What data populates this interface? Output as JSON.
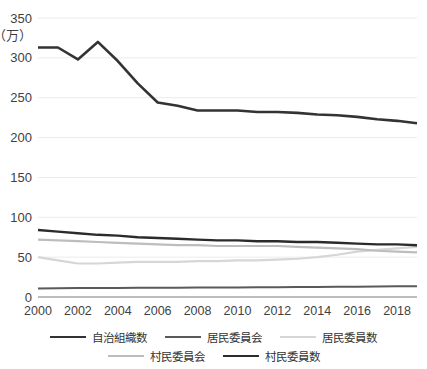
{
  "chart_data": {
    "type": "line",
    "title": "",
    "subtitle": "",
    "xlabel": "",
    "ylabel": "",
    "unit_label": "（万）",
    "xlim": [
      2000,
      2019
    ],
    "ylim": [
      0,
      350
    ],
    "ytick_values": [
      0,
      50,
      100,
      150,
      200,
      250,
      300,
      350
    ],
    "ytick_labels": [
      "0",
      "50",
      "100",
      "150",
      "200",
      "250",
      "300",
      "350"
    ],
    "xtick_values": [
      2000,
      2002,
      2004,
      2006,
      2008,
      2010,
      2012,
      2014,
      2016,
      2018
    ],
    "xtick_labels": [
      "2000",
      "2002",
      "2004",
      "2006",
      "2008",
      "2010",
      "2012",
      "2014",
      "2016",
      "2018"
    ],
    "grid": true,
    "grid_axis": "y",
    "legend_position": "bottom",
    "x": [
      2000,
      2001,
      2002,
      2003,
      2004,
      2005,
      2006,
      2007,
      2008,
      2009,
      2010,
      2011,
      2012,
      2013,
      2014,
      2015,
      2016,
      2017,
      2018,
      2019
    ],
    "series": [
      {
        "name": "自治組織数",
        "color": "#333333",
        "width": 2.6,
        "values": [
          313,
          313,
          298,
          320,
          296,
          268,
          244,
          240,
          234,
          234,
          234,
          232,
          232,
          231,
          229,
          228,
          226,
          223,
          221,
          218
        ]
      },
      {
        "name": "居民委員会",
        "color": "#5a5a5a",
        "width": 2.0,
        "values": [
          10.8,
          11.0,
          11.2,
          11.3,
          11.4,
          11.5,
          11.6,
          11.7,
          11.8,
          11.9,
          12.0,
          12.1,
          12.2,
          12.4,
          12.6,
          12.8,
          13.0,
          13.2,
          13.4,
          13.6
        ]
      },
      {
        "name": "居民委員数",
        "color": "#d6d6d6",
        "width": 2.2,
        "values": [
          50,
          46,
          42,
          42,
          43,
          44,
          44,
          44,
          45,
          45,
          46,
          46,
          47,
          48,
          50,
          53,
          57,
          59,
          61,
          63
        ]
      },
      {
        "name": "村民委員会",
        "color": "#bdbdbd",
        "width": 2.2,
        "values": [
          72,
          71,
          70,
          69,
          68,
          67,
          66,
          65,
          65,
          64,
          64,
          64,
          64,
          63,
          62,
          61,
          60,
          58,
          57,
          56
        ]
      },
      {
        "name": "村民委員数",
        "color": "#2b2b2b",
        "width": 2.4,
        "values": [
          84,
          82,
          80,
          78,
          77,
          75,
          74,
          73,
          72,
          71,
          71,
          70,
          70,
          69,
          69,
          68,
          67,
          66,
          66,
          65
        ]
      }
    ]
  },
  "legend": {
    "rows": [
      [
        {
          "label": "自治組織数",
          "color": "#333333",
          "width": 2.8
        },
        {
          "label": "居民委員会",
          "color": "#5a5a5a",
          "width": 2.2
        },
        {
          "label": "居民委員数",
          "color": "#d6d6d6",
          "width": 2.4
        }
      ],
      [
        {
          "label": "村民委員会",
          "color": "#bdbdbd",
          "width": 2.4
        },
        {
          "label": "村民委員数",
          "color": "#2b2b2b",
          "width": 2.8
        }
      ]
    ]
  },
  "axes": {
    "grid_color": "#ebebeb",
    "axis_color": "#7a7a7a",
    "tick_text_color": "#3f3f3f",
    "background": "#ffffff"
  }
}
